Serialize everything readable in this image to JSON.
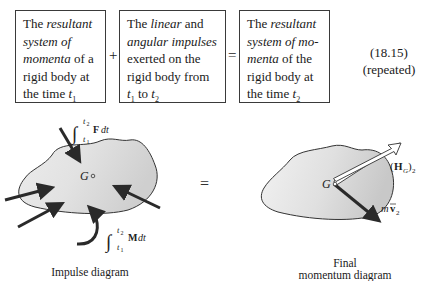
{
  "equation": {
    "term1": {
      "line1_a": "The ",
      "line1_b": "resultant",
      "line2": "system of",
      "line3_a": "momenta",
      "line3_b": " of a",
      "line4": "rigid body at",
      "line5_a": "the time ",
      "line5_t": "t",
      "line5_sub": "1"
    },
    "plus": "+",
    "term2": {
      "line1_a": "The ",
      "line1_b": "linear",
      "line1_c": " and",
      "line2": "angular impulses",
      "line3": "exerted on the",
      "line4": "rigid body from",
      "line5_t1": "t",
      "line5_sub1": "1",
      "line5_mid": " to ",
      "line5_t2": "t",
      "line5_sub2": "2"
    },
    "equals": "=",
    "term3": {
      "line1_a": "The ",
      "line1_b": "resultant",
      "line2": "system of mo-",
      "line3_a": "menta",
      "line3_b": " of the",
      "line4": "rigid body at",
      "line5_a": "the time ",
      "line5_t": "t",
      "line5_sub": "2"
    },
    "number": "(18.15)",
    "note": "(repeated)"
  },
  "impulse_diagram": {
    "caption": "Impulse diagram",
    "center_label": "G",
    "force_impulse_label": {
      "int": "∫",
      "upper": "t2",
      "lower": "t1",
      "body": "F dt"
    },
    "moment_impulse_label": {
      "int": "∫",
      "upper": "t2",
      "lower": "t1",
      "body": "M dt"
    },
    "body_fill": "#d4d4d4"
  },
  "diagram_equals": "=",
  "momentum_diagram": {
    "caption_line1": "Final",
    "caption_line2": "momentum diagram",
    "center_label": "G",
    "angular_momentum_label": "(H",
    "angular_momentum_sub": "G",
    "angular_momentum_close": ")",
    "angular_momentum_sub2": "2",
    "linear_momentum_label": "mv̄",
    "linear_momentum_sub": "2"
  }
}
